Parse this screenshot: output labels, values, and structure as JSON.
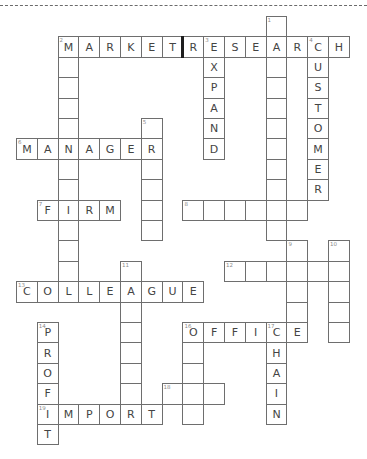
{
  "puzzle": {
    "grid_origin": {
      "x": 16,
      "y": 16,
      "cell_w": 20.8,
      "cell_h": 20.4
    },
    "separator": {
      "row": 1,
      "between_cols": [
        7,
        8
      ],
      "color": "#1e1e1e"
    },
    "cells": [
      {
        "r": 0,
        "c": 12,
        "n": "1",
        "l": ""
      },
      {
        "r": 1,
        "c": 2,
        "n": "2",
        "l": "M"
      },
      {
        "r": 1,
        "c": 3,
        "n": "",
        "l": "A"
      },
      {
        "r": 1,
        "c": 4,
        "n": "",
        "l": "R"
      },
      {
        "r": 1,
        "c": 5,
        "n": "",
        "l": "K"
      },
      {
        "r": 1,
        "c": 6,
        "n": "",
        "l": "E"
      },
      {
        "r": 1,
        "c": 7,
        "n": "",
        "l": "T"
      },
      {
        "r": 1,
        "c": 8,
        "n": "",
        "l": "R"
      },
      {
        "r": 1,
        "c": 9,
        "n": "3",
        "l": "E"
      },
      {
        "r": 1,
        "c": 10,
        "n": "",
        "l": "S"
      },
      {
        "r": 1,
        "c": 11,
        "n": "",
        "l": "E"
      },
      {
        "r": 1,
        "c": 12,
        "n": "",
        "l": "A"
      },
      {
        "r": 1,
        "c": 13,
        "n": "",
        "l": "R"
      },
      {
        "r": 1,
        "c": 14,
        "n": "4",
        "l": "C"
      },
      {
        "r": 1,
        "c": 15,
        "n": "",
        "l": "H"
      },
      {
        "r": 2,
        "c": 2,
        "n": "",
        "l": ""
      },
      {
        "r": 2,
        "c": 9,
        "n": "",
        "l": "X"
      },
      {
        "r": 2,
        "c": 12,
        "n": "",
        "l": ""
      },
      {
        "r": 2,
        "c": 14,
        "n": "",
        "l": "U"
      },
      {
        "r": 3,
        "c": 2,
        "n": "",
        "l": ""
      },
      {
        "r": 3,
        "c": 9,
        "n": "",
        "l": "P"
      },
      {
        "r": 3,
        "c": 12,
        "n": "",
        "l": ""
      },
      {
        "r": 3,
        "c": 14,
        "n": "",
        "l": "S"
      },
      {
        "r": 4,
        "c": 2,
        "n": "",
        "l": ""
      },
      {
        "r": 4,
        "c": 9,
        "n": "",
        "l": "A"
      },
      {
        "r": 4,
        "c": 12,
        "n": "",
        "l": ""
      },
      {
        "r": 4,
        "c": 14,
        "n": "",
        "l": "T"
      },
      {
        "r": 5,
        "c": 2,
        "n": "",
        "l": ""
      },
      {
        "r": 5,
        "c": 6,
        "n": "5",
        "l": ""
      },
      {
        "r": 5,
        "c": 9,
        "n": "",
        "l": "N"
      },
      {
        "r": 5,
        "c": 12,
        "n": "",
        "l": ""
      },
      {
        "r": 5,
        "c": 14,
        "n": "",
        "l": "O"
      },
      {
        "r": 6,
        "c": 0,
        "n": "6",
        "l": "M"
      },
      {
        "r": 6,
        "c": 1,
        "n": "",
        "l": "A"
      },
      {
        "r": 6,
        "c": 2,
        "n": "",
        "l": "N"
      },
      {
        "r": 6,
        "c": 3,
        "n": "",
        "l": "A"
      },
      {
        "r": 6,
        "c": 4,
        "n": "",
        "l": "G"
      },
      {
        "r": 6,
        "c": 5,
        "n": "",
        "l": "E"
      },
      {
        "r": 6,
        "c": 6,
        "n": "",
        "l": "R"
      },
      {
        "r": 6,
        "c": 9,
        "n": "",
        "l": "D"
      },
      {
        "r": 6,
        "c": 12,
        "n": "",
        "l": ""
      },
      {
        "r": 6,
        "c": 14,
        "n": "",
        "l": "M"
      },
      {
        "r": 7,
        "c": 2,
        "n": "",
        "l": ""
      },
      {
        "r": 7,
        "c": 6,
        "n": "",
        "l": ""
      },
      {
        "r": 7,
        "c": 12,
        "n": "",
        "l": ""
      },
      {
        "r": 7,
        "c": 14,
        "n": "",
        "l": "E"
      },
      {
        "r": 8,
        "c": 2,
        "n": "",
        "l": ""
      },
      {
        "r": 8,
        "c": 6,
        "n": "",
        "l": ""
      },
      {
        "r": 8,
        "c": 12,
        "n": "",
        "l": ""
      },
      {
        "r": 8,
        "c": 14,
        "n": "",
        "l": "R"
      },
      {
        "r": 9,
        "c": 1,
        "n": "7",
        "l": "F"
      },
      {
        "r": 9,
        "c": 2,
        "n": "",
        "l": "I"
      },
      {
        "r": 9,
        "c": 3,
        "n": "",
        "l": "R"
      },
      {
        "r": 9,
        "c": 4,
        "n": "",
        "l": "M"
      },
      {
        "r": 9,
        "c": 6,
        "n": "",
        "l": ""
      },
      {
        "r": 9,
        "c": 8,
        "n": "8",
        "l": ""
      },
      {
        "r": 9,
        "c": 9,
        "n": "",
        "l": ""
      },
      {
        "r": 9,
        "c": 10,
        "n": "",
        "l": ""
      },
      {
        "r": 9,
        "c": 11,
        "n": "",
        "l": ""
      },
      {
        "r": 9,
        "c": 12,
        "n": "",
        "l": ""
      },
      {
        "r": 9,
        "c": 13,
        "n": "",
        "l": ""
      },
      {
        "r": 10,
        "c": 2,
        "n": "",
        "l": ""
      },
      {
        "r": 10,
        "c": 6,
        "n": "",
        "l": ""
      },
      {
        "r": 10,
        "c": 12,
        "n": "",
        "l": ""
      },
      {
        "r": 11,
        "c": 2,
        "n": "",
        "l": ""
      },
      {
        "r": 11,
        "c": 13,
        "n": "9",
        "l": ""
      },
      {
        "r": 11,
        "c": 15,
        "n": "10",
        "l": ""
      },
      {
        "r": 12,
        "c": 2,
        "n": "",
        "l": ""
      },
      {
        "r": 12,
        "c": 5,
        "n": "11",
        "l": ""
      },
      {
        "r": 12,
        "c": 10,
        "n": "12",
        "l": ""
      },
      {
        "r": 12,
        "c": 11,
        "n": "",
        "l": ""
      },
      {
        "r": 12,
        "c": 12,
        "n": "",
        "l": ""
      },
      {
        "r": 12,
        "c": 13,
        "n": "",
        "l": ""
      },
      {
        "r": 12,
        "c": 14,
        "n": "",
        "l": ""
      },
      {
        "r": 12,
        "c": 15,
        "n": "",
        "l": ""
      },
      {
        "r": 13,
        "c": 0,
        "n": "13",
        "l": "C"
      },
      {
        "r": 13,
        "c": 1,
        "n": "",
        "l": "O"
      },
      {
        "r": 13,
        "c": 2,
        "n": "",
        "l": "L"
      },
      {
        "r": 13,
        "c": 3,
        "n": "",
        "l": "L"
      },
      {
        "r": 13,
        "c": 4,
        "n": "",
        "l": "E"
      },
      {
        "r": 13,
        "c": 5,
        "n": "",
        "l": "A"
      },
      {
        "r": 13,
        "c": 6,
        "n": "",
        "l": "G"
      },
      {
        "r": 13,
        "c": 7,
        "n": "",
        "l": "U"
      },
      {
        "r": 13,
        "c": 8,
        "n": "",
        "l": "E"
      },
      {
        "r": 13,
        "c": 13,
        "n": "",
        "l": ""
      },
      {
        "r": 13,
        "c": 15,
        "n": "",
        "l": ""
      },
      {
        "r": 14,
        "c": 5,
        "n": "",
        "l": ""
      },
      {
        "r": 14,
        "c": 13,
        "n": "",
        "l": ""
      },
      {
        "r": 14,
        "c": 15,
        "n": "",
        "l": ""
      },
      {
        "r": 15,
        "c": 1,
        "n": "14",
        "l": "P"
      },
      {
        "r": 15,
        "c": 5,
        "n": "",
        "l": ""
      },
      {
        "r": 15,
        "c": 8,
        "n": "16",
        "l": "O"
      },
      {
        "r": 15,
        "c": 9,
        "n": "",
        "l": "F"
      },
      {
        "r": 15,
        "c": 10,
        "n": "",
        "l": "F"
      },
      {
        "r": 15,
        "c": 11,
        "n": "",
        "l": "I"
      },
      {
        "r": 15,
        "c": 12,
        "n": "17",
        "l": "C"
      },
      {
        "r": 15,
        "c": 13,
        "n": "",
        "l": "E"
      },
      {
        "r": 15,
        "c": 15,
        "n": "",
        "l": ""
      },
      {
        "r": 16,
        "c": 1,
        "n": "",
        "l": "R"
      },
      {
        "r": 16,
        "c": 5,
        "n": "",
        "l": ""
      },
      {
        "r": 16,
        "c": 8,
        "n": "",
        "l": ""
      },
      {
        "r": 16,
        "c": 12,
        "n": "",
        "l": "H"
      },
      {
        "r": 17,
        "c": 1,
        "n": "",
        "l": "O"
      },
      {
        "r": 17,
        "c": 5,
        "n": "",
        "l": ""
      },
      {
        "r": 17,
        "c": 8,
        "n": "",
        "l": ""
      },
      {
        "r": 17,
        "c": 12,
        "n": "",
        "l": "A"
      },
      {
        "r": 18,
        "c": 1,
        "n": "",
        "l": "F"
      },
      {
        "r": 18,
        "c": 5,
        "n": "",
        "l": ""
      },
      {
        "r": 18,
        "c": 7,
        "n": "18",
        "l": ""
      },
      {
        "r": 18,
        "c": 8,
        "n": "",
        "l": ""
      },
      {
        "r": 18,
        "c": 9,
        "n": "",
        "l": ""
      },
      {
        "r": 18,
        "c": 12,
        "n": "",
        "l": "I"
      },
      {
        "r": 19,
        "c": 1,
        "n": "19",
        "l": "I"
      },
      {
        "r": 19,
        "c": 2,
        "n": "",
        "l": "M"
      },
      {
        "r": 19,
        "c": 3,
        "n": "",
        "l": "P"
      },
      {
        "r": 19,
        "c": 4,
        "n": "",
        "l": "O"
      },
      {
        "r": 19,
        "c": 5,
        "n": "",
        "l": "R"
      },
      {
        "r": 19,
        "c": 6,
        "n": "",
        "l": "T"
      },
      {
        "r": 19,
        "c": 8,
        "n": "",
        "l": ""
      },
      {
        "r": 19,
        "c": 12,
        "n": "",
        "l": "N"
      },
      {
        "r": 20,
        "c": 1,
        "n": "",
        "l": "T"
      }
    ]
  },
  "words": {
    "across": [
      {
        "num": "2",
        "answer": "MARKET RESEARCH"
      },
      {
        "num": "6",
        "answer": "MANAGER"
      },
      {
        "num": "7",
        "answer": "FIRM"
      },
      {
        "num": "8",
        "answer": ""
      },
      {
        "num": "12",
        "answer": ""
      },
      {
        "num": "13",
        "answer": "COLLEAGUE"
      },
      {
        "num": "16",
        "answer": "OFFICE"
      },
      {
        "num": "18",
        "answer": ""
      },
      {
        "num": "19",
        "answer": "IMPORT"
      }
    ],
    "down": [
      {
        "num": "1",
        "answer": ""
      },
      {
        "num": "2",
        "answer": ""
      },
      {
        "num": "3",
        "answer": "EXPAND"
      },
      {
        "num": "4",
        "answer": "CUSTOMER"
      },
      {
        "num": "5",
        "answer": ""
      },
      {
        "num": "9",
        "answer": ""
      },
      {
        "num": "10",
        "answer": ""
      },
      {
        "num": "11",
        "answer": ""
      },
      {
        "num": "14",
        "answer": "PROFIT"
      },
      {
        "num": "16",
        "answer": ""
      },
      {
        "num": "17",
        "answer": "CHAIN"
      }
    ]
  }
}
